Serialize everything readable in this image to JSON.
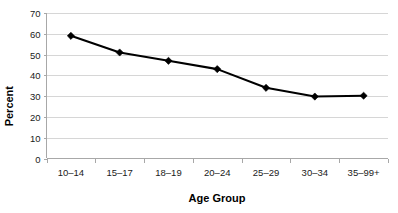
{
  "chart_data": {
    "type": "line",
    "title": "",
    "xlabel": "Age Group",
    "ylabel": "Percent",
    "categories": [
      "10–14",
      "15–17",
      "18–19",
      "20–24",
      "25–29",
      "30–34",
      "35–99+"
    ],
    "values": [
      59,
      51,
      47,
      43,
      34,
      29.8,
      30.2
    ],
    "ylim": [
      0,
      70
    ],
    "yticks": [
      0,
      10,
      20,
      30,
      40,
      50,
      60,
      70
    ],
    "ytick_labels": [
      "0",
      "10",
      "20",
      "30",
      "40",
      "50",
      "60",
      "70"
    ],
    "grid": "horizontal",
    "legend": "none",
    "marker": "diamond",
    "series": [
      {
        "name": "Percent",
        "values": [
          59,
          51,
          47,
          43,
          34,
          29.8,
          30.2
        ]
      }
    ],
    "colors": {
      "line": "#000000",
      "marker": "#000000",
      "grid": "#d6d6d6",
      "axis": "#a8a8a8",
      "background": "#ffffff",
      "text": "#000000"
    }
  }
}
